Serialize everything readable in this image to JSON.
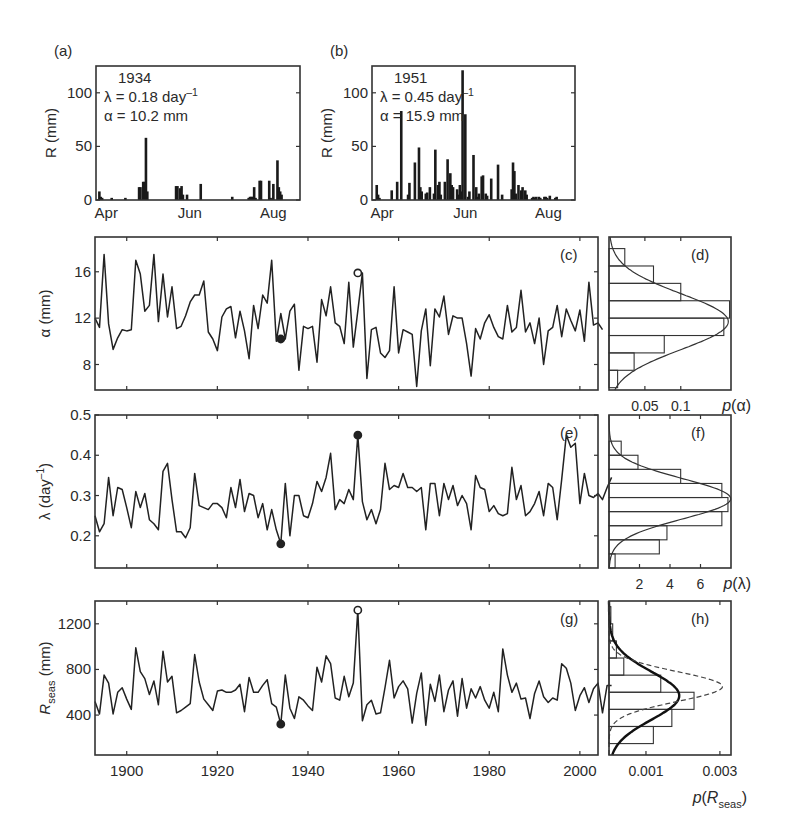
{
  "chart_data": [
    {
      "id": "a",
      "type": "bar",
      "panel_label": "(a)",
      "title": "1934",
      "annotations": [
        "λ = 0.18 day⁻¹",
        "α = 10.2 mm"
      ],
      "ylabel": "R (mm)",
      "xlabel": "",
      "ylim": [
        0,
        125
      ],
      "yticks": [
        0,
        50,
        100
      ],
      "xticks": [
        "Apr",
        "Jun",
        "Aug"
      ],
      "grid": false,
      "days": [
        1,
        2,
        3,
        10,
        20,
        30,
        31,
        33,
        34,
        35,
        36,
        57,
        58,
        60,
        61,
        62,
        65,
        75,
        98,
        110,
        111,
        112,
        113,
        114,
        115,
        118,
        119,
        125,
        126,
        128,
        131,
        132,
        133,
        134
      ],
      "values": [
        8,
        3,
        2,
        2,
        2,
        12,
        12,
        17,
        17,
        58,
        8,
        13,
        13,
        11,
        13,
        5,
        5,
        15,
        3,
        2,
        3,
        3,
        3,
        12,
        2,
        18,
        18,
        18,
        2,
        15,
        37,
        12,
        8,
        5
      ]
    },
    {
      "id": "b",
      "type": "bar",
      "panel_label": "(b)",
      "title": "1951",
      "annotations": [
        "λ = 0.45 day⁻¹",
        "α = 15.9 mm"
      ],
      "ylabel": "R (mm)",
      "xlabel": "",
      "ylim": [
        0,
        125
      ],
      "yticks": [
        0,
        50,
        100
      ],
      "xticks": [
        "Apr",
        "Jun",
        "Aug"
      ],
      "grid": false,
      "days": [
        2,
        3,
        4,
        13,
        17,
        20,
        25,
        26,
        30,
        33,
        34,
        35,
        38,
        39,
        41,
        44,
        45,
        47,
        48,
        49,
        52,
        54,
        56,
        57,
        58,
        61,
        62,
        63,
        64,
        65,
        67,
        69,
        70,
        73,
        75,
        76,
        77,
        79,
        80,
        82,
        83,
        86,
        91,
        94,
        101,
        102,
        103,
        104,
        106,
        108,
        109,
        111,
        112,
        116,
        117,
        118,
        119,
        121,
        122,
        125,
        126,
        127,
        129,
        133,
        134
      ],
      "values": [
        14,
        5,
        2,
        9,
        17,
        83,
        5,
        16,
        35,
        49,
        12,
        8,
        6,
        7,
        12,
        6,
        47,
        14,
        17,
        5,
        17,
        38,
        25,
        14,
        12,
        10,
        5,
        14,
        8,
        121,
        80,
        3,
        8,
        42,
        12,
        3,
        6,
        22,
        23,
        6,
        4,
        20,
        33,
        5,
        10,
        35,
        27,
        6,
        14,
        9,
        12,
        9,
        5,
        2,
        3,
        2,
        3,
        3,
        2,
        3,
        3,
        2,
        4,
        2,
        3
      ]
    },
    {
      "id": "c",
      "type": "line",
      "panel_label": "(c)",
      "ylabel": "α (mm)",
      "xlabel": "",
      "ylim": [
        5.8,
        19
      ],
      "yticks": [
        8,
        12,
        16
      ],
      "xlim": [
        1893,
        2004
      ],
      "xticks": [
        1900,
        1920,
        1940,
        1960,
        1980,
        2000
      ],
      "grid": false,
      "x_start": 1893,
      "values": [
        12.0,
        11.2,
        17.5,
        11.5,
        9.3,
        10.3,
        11.0,
        10.9,
        11.0,
        17.0,
        15.8,
        12.6,
        13.1,
        17.5,
        11.7,
        15.8,
        12.1,
        14.7,
        11.1,
        11.3,
        12.2,
        13.4,
        14.0,
        14.0,
        15.2,
        10.8,
        10.2,
        9.2,
        12.1,
        12.8,
        13.0,
        10.3,
        12.6,
        10.9,
        8.5,
        13.1,
        11.1,
        14.0,
        13.3,
        17.0,
        10.0,
        12.4,
        10.2,
        12.6,
        13.2,
        7.5,
        11.3,
        11.1,
        11.3,
        8.2,
        13.6,
        12.2,
        14.7,
        11.6,
        11.3,
        9.8,
        15.1,
        9.5,
        12.6,
        15.9,
        6.8,
        11.0,
        11.2,
        9.0,
        8.6,
        9.2,
        14.7,
        9.0,
        11.0,
        10.8,
        10.6,
        6.1,
        10.9,
        12.8,
        7.9,
        12.8,
        12.1,
        13.9,
        10.6,
        12.2,
        12.0,
        12.0,
        9.8,
        7.0,
        11.1,
        10.2,
        11.6,
        12.3,
        11.2,
        10.4,
        10.2,
        13.1,
        10.8,
        11.2,
        14.4,
        10.8,
        11.6,
        9.8,
        12.0,
        8.0,
        10.9,
        11.2,
        13.1,
        10.4,
        12.8,
        11.8,
        10.9,
        12.7,
        10.0,
        15.1,
        11.4,
        11.6,
        11.0
      ],
      "markers": [
        {
          "year": 1934,
          "value": 10.2,
          "style": "filled"
        },
        {
          "year": 1951,
          "value": 15.9,
          "style": "open"
        }
      ]
    },
    {
      "id": "d",
      "type": "bar",
      "orientation": "horizontal",
      "panel_label": "(d)",
      "xlabel": "p(α)",
      "xlim": [
        0,
        0.17
      ],
      "xticks": [
        0.05,
        0.1
      ],
      "bin_edges": [
        6,
        7.5,
        9,
        10.5,
        12,
        13.5,
        15,
        16.5,
        18
      ],
      "densities": [
        0.012,
        0.035,
        0.077,
        0.16,
        0.168,
        0.1,
        0.062,
        0.022
      ],
      "fit": "normal",
      "fit_mean": 11.7,
      "fit_sd": 2.4
    },
    {
      "id": "e",
      "type": "line",
      "panel_label": "(e)",
      "ylabel": "λ (day⁻¹)",
      "xlabel": "",
      "ylim": [
        0.12,
        0.5
      ],
      "yticks": [
        0.2,
        0.3,
        0.4,
        0.5
      ],
      "xlim": [
        1893,
        2004
      ],
      "xticks": [
        1900,
        1920,
        1940,
        1960,
        1980,
        2000
      ],
      "grid": false,
      "x_start": 1893,
      "values": [
        0.25,
        0.21,
        0.23,
        0.345,
        0.25,
        0.32,
        0.315,
        0.27,
        0.22,
        0.31,
        0.27,
        0.305,
        0.24,
        0.23,
        0.215,
        0.36,
        0.38,
        0.29,
        0.21,
        0.21,
        0.195,
        0.22,
        0.355,
        0.275,
        0.27,
        0.265,
        0.28,
        0.28,
        0.27,
        0.245,
        0.32,
        0.27,
        0.34,
        0.26,
        0.305,
        0.3,
        0.245,
        0.28,
        0.215,
        0.265,
        0.215,
        0.18,
        0.33,
        0.2,
        0.3,
        0.3,
        0.25,
        0.245,
        0.28,
        0.335,
        0.31,
        0.345,
        0.405,
        0.265,
        0.29,
        0.28,
        0.315,
        0.29,
        0.45,
        0.285,
        0.24,
        0.265,
        0.23,
        0.265,
        0.38,
        0.315,
        0.325,
        0.32,
        0.355,
        0.32,
        0.32,
        0.31,
        0.32,
        0.215,
        0.33,
        0.33,
        0.25,
        0.33,
        0.29,
        0.325,
        0.275,
        0.3,
        0.28,
        0.215,
        0.35,
        0.32,
        0.315,
        0.26,
        0.275,
        0.255,
        0.25,
        0.255,
        0.37,
        0.29,
        0.325,
        0.25,
        0.26,
        0.28,
        0.31,
        0.25,
        0.33,
        0.32,
        0.24,
        0.34,
        0.45,
        0.42,
        0.43,
        0.28,
        0.355,
        0.3,
        0.295,
        0.305,
        0.29,
        0.32,
        0.345
      ],
      "markers": [
        {
          "year": 1934,
          "value": 0.18,
          "style": "filled"
        },
        {
          "year": 1951,
          "value": 0.45,
          "style": "filled"
        }
      ]
    },
    {
      "id": "f",
      "type": "bar",
      "orientation": "horizontal",
      "panel_label": "(f)",
      "xlabel": "p(λ)",
      "xlim": [
        0,
        8
      ],
      "xticks": [
        2,
        4,
        6
      ],
      "bin_edges": [
        0.12,
        0.155,
        0.19,
        0.225,
        0.26,
        0.295,
        0.33,
        0.365,
        0.4,
        0.435
      ],
      "densities": [
        0.4,
        3.3,
        3.8,
        7.4,
        7.8,
        7.4,
        4.7,
        1.9,
        0.8
      ],
      "fit": "normal",
      "fit_mean": 0.292,
      "fit_sd": 0.05
    },
    {
      "id": "g",
      "type": "line",
      "panel_label": "(g)",
      "ylabel": "R_seas (mm)",
      "xlabel": "",
      "ylim": [
        50,
        1400
      ],
      "yticks": [
        400,
        800,
        1200
      ],
      "xlim": [
        1893,
        2004
      ],
      "xticks": [
        1900,
        1920,
        1940,
        1960,
        1980,
        2000
      ],
      "grid": false,
      "x_start": 1893,
      "values": [
        520,
        410,
        750,
        680,
        410,
        600,
        640,
        540,
        450,
        990,
        780,
        720,
        580,
        700,
        490,
        960,
        690,
        740,
        420,
        440,
        470,
        500,
        930,
        690,
        540,
        490,
        440,
        610,
        620,
        600,
        600,
        620,
        670,
        430,
        730,
        600,
        600,
        660,
        710,
        500,
        470,
        320,
        750,
        460,
        370,
        560,
        530,
        480,
        440,
        820,
        690,
        920,
        850,
        550,
        530,
        740,
        560,
        680,
        1320,
        350,
        490,
        530,
        410,
        420,
        640,
        880,
        550,
        650,
        700,
        630,
        330,
        590,
        770,
        310,
        670,
        520,
        750,
        430,
        620,
        700,
        390,
        720,
        460,
        630,
        550,
        650,
        530,
        460,
        600,
        430,
        980,
        750,
        600,
        680,
        540,
        550,
        370,
        590,
        700,
        560,
        510,
        550,
        530,
        850,
        810,
        680,
        440,
        570,
        640,
        510,
        630,
        680,
        420,
        660,
        660
      ],
      "markers": [
        {
          "year": 1934,
          "value": 320,
          "style": "filled"
        },
        {
          "year": 1951,
          "value": 1320,
          "style": "open"
        }
      ]
    },
    {
      "id": "h",
      "type": "bar",
      "orientation": "horizontal",
      "panel_label": "(h)",
      "xlabel": "p(R_seas)",
      "xlim": [
        0,
        0.0033
      ],
      "xticks": [
        0.001,
        0.003
      ],
      "bin_edges": [
        150,
        300,
        450,
        600,
        750,
        900,
        1050,
        1200,
        1350
      ],
      "densities": [
        0.0012,
        0.0017,
        0.0023,
        0.0014,
        0.0004,
        0.0002,
        0.0001,
        5e-05
      ],
      "fit": "normal",
      "fit_curves": [
        {
          "style": "solid-bold",
          "mean": 570,
          "sd": 210
        },
        {
          "style": "dashed",
          "mean": 650,
          "sd": 130
        }
      ]
    }
  ],
  "labels": {
    "tick_text_color": "#2a2a2a",
    "axis_color": "#333333",
    "line_color": "#222222"
  }
}
